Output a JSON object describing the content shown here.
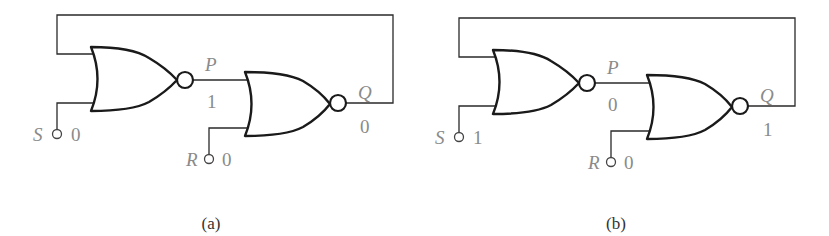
{
  "figure": {
    "panels": [
      {
        "caption": "(a)",
        "inputs": {
          "S": {
            "label": "S",
            "value": "0"
          },
          "R": {
            "label": "R",
            "value": "0"
          }
        },
        "nodes": {
          "P": {
            "label": "P",
            "value": "1"
          },
          "Q": {
            "label": "Q",
            "value": "0"
          }
        }
      },
      {
        "caption": "(b)",
        "inputs": {
          "S": {
            "label": "S",
            "value": "1"
          },
          "R": {
            "label": "R",
            "value": "0"
          }
        },
        "nodes": {
          "P": {
            "label": "P",
            "value": "0"
          },
          "Q": {
            "label": "Q",
            "value": "1"
          }
        }
      }
    ],
    "colors": {
      "wire": "#2a2a2a",
      "gate": "#1a1a1a",
      "label": "#8a8a8a",
      "caption": "#333333"
    }
  }
}
